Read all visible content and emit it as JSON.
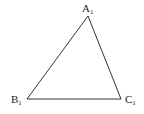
{
  "diagram": {
    "type": "triangle",
    "stroke_color": "#333333",
    "vertices": [
      {
        "id": "A",
        "label": "A",
        "subscript": "1",
        "x": 88,
        "y": 16
      },
      {
        "id": "B",
        "label": "B",
        "subscript": "1",
        "x": 27,
        "y": 99
      },
      {
        "id": "C",
        "label": "C",
        "subscript": "1",
        "x": 121,
        "y": 99
      }
    ]
  }
}
